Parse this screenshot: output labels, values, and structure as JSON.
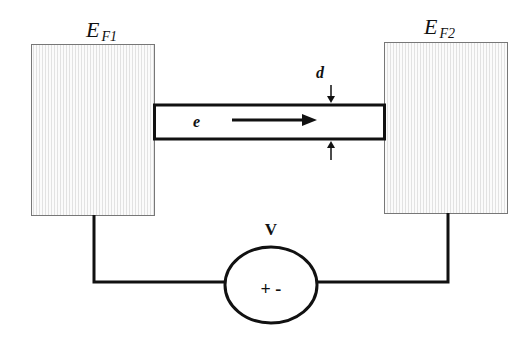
{
  "diagram": {
    "left_electrode": {
      "label_main": "E",
      "label_sub": "F1"
    },
    "right_electrode": {
      "label_main": "E",
      "label_sub": "F2"
    },
    "channel": {
      "carrier_label": "e",
      "thickness_label": "d"
    },
    "source": {
      "label": "V",
      "polarity": "+ -"
    }
  },
  "colors": {
    "line": "#111111",
    "electrode_fill": "#f4f4f4",
    "electrode_border": "#777777"
  }
}
